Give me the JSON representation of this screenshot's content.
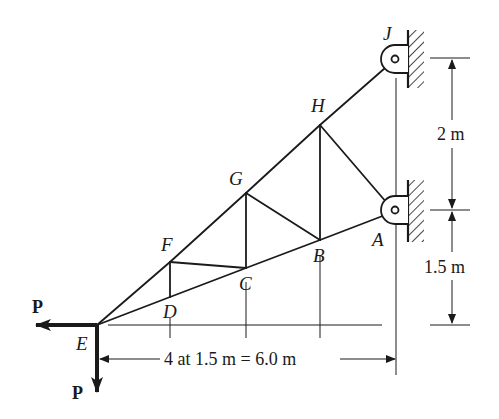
{
  "figure": {
    "type": "truss-diagram",
    "nodes": {
      "A": {
        "label": "A"
      },
      "B": {
        "label": "B"
      },
      "C": {
        "label": "C"
      },
      "D": {
        "label": "D"
      },
      "E": {
        "label": "E"
      },
      "F": {
        "label": "F"
      },
      "G": {
        "label": "G"
      },
      "H": {
        "label": "H"
      },
      "J": {
        "label": "J"
      }
    },
    "members": [
      [
        "E",
        "D"
      ],
      [
        "D",
        "C"
      ],
      [
        "C",
        "B"
      ],
      [
        "B",
        "A"
      ],
      [
        "E",
        "F"
      ],
      [
        "F",
        "G"
      ],
      [
        "G",
        "H"
      ],
      [
        "H",
        "J"
      ],
      [
        "D",
        "F"
      ],
      [
        "F",
        "C"
      ],
      [
        "C",
        "G"
      ],
      [
        "G",
        "B"
      ],
      [
        "B",
        "H"
      ],
      [
        "H",
        "A"
      ]
    ],
    "supports": [
      {
        "node": "J",
        "type": "pin-to-wall"
      },
      {
        "node": "A",
        "type": "pin-to-wall"
      }
    ],
    "loads": [
      {
        "node": "E",
        "direction": "left",
        "label": "P"
      },
      {
        "node": "E",
        "direction": "down",
        "label": "P"
      }
    ],
    "dimensions": {
      "horizontal": "4 at 1.5 m = 6.0 m",
      "vertical_upper": "2 m",
      "vertical_lower": "1.5 m"
    }
  }
}
